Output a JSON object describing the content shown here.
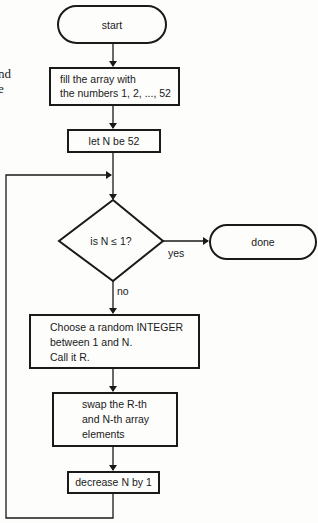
{
  "page_fragment": {
    "lines": [
      "nd",
      "e"
    ]
  },
  "flowchart": {
    "start": {
      "label": "start"
    },
    "fill_array": {
      "lines": [
        "fill the array with",
        "the numbers 1, 2, ..., 52"
      ]
    },
    "init_n": {
      "label": "let N be 52"
    },
    "decision": {
      "label": "is N ≤ 1?",
      "yes_label": "yes",
      "no_label": "no"
    },
    "done": {
      "label": "done"
    },
    "choose_random": {
      "lines": [
        "Choose a random INTEGER",
        "between 1 and N.",
        "Call it R."
      ]
    },
    "swap": {
      "lines": [
        "swap the R-th",
        "and N-th array",
        "elements"
      ]
    },
    "decrement": {
      "label": "decrease N by 1"
    }
  },
  "colors": {
    "stroke": "#1a1a1a",
    "background": "#fdfdfc"
  }
}
